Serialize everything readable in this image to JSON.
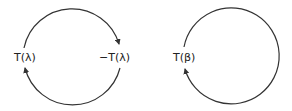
{
  "diagram": {
    "left_cycle": {
      "label_left": "T(λ)",
      "label_right": "−T(λ)",
      "arrows": [
        "top arc: T(λ) to −T(λ)",
        "bottom arc: −T(λ) to T(λ)"
      ]
    },
    "right_cycle": {
      "label_left": "T(β)",
      "arrows": [
        "full loop: T(β) back to T(β)"
      ]
    },
    "colors": {
      "stroke": "#333333",
      "text": "#222222",
      "background": "#ffffff"
    }
  }
}
